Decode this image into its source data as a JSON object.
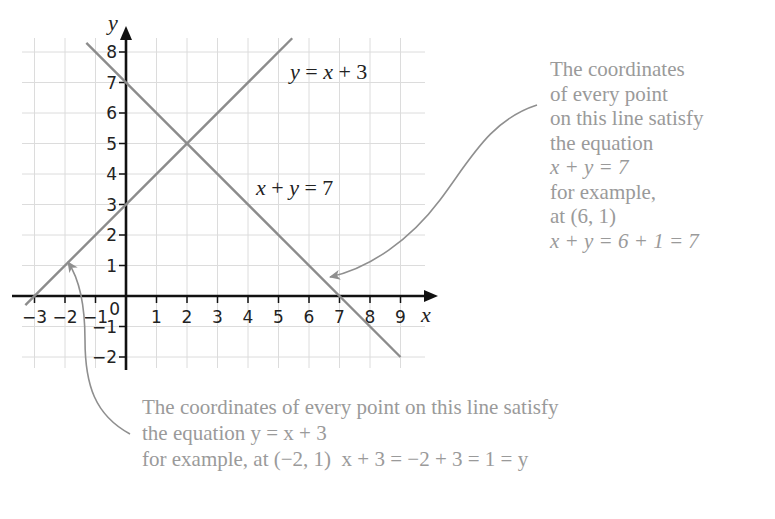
{
  "chart_data": {
    "type": "line",
    "title": "",
    "xlabel": "x",
    "ylabel": "y",
    "xlim": [
      -3.4,
      9.8
    ],
    "ylim": [
      -2.4,
      8.6
    ],
    "grid": true,
    "x_ticks": [
      "-3",
      "-2",
      "-1",
      "0",
      "1",
      "2",
      "3",
      "4",
      "5",
      "6",
      "7",
      "8",
      "9"
    ],
    "y_ticks": [
      "-2",
      "-1",
      "1",
      "2",
      "3",
      "4",
      "5",
      "6",
      "7",
      "8"
    ],
    "series": [
      {
        "name": "y = x + 3",
        "equation": "y = x + 3",
        "x": [
          -3.3,
          5.45
        ],
        "y": [
          -0.3,
          8.45
        ],
        "color": "#8c8c8c"
      },
      {
        "name": "x + y = 7",
        "equation": "x + y = 7",
        "x": [
          -1.3,
          9.0
        ],
        "y": [
          8.3,
          -2.0
        ],
        "color": "#8c8c8c"
      }
    ],
    "annotations": [
      {
        "text": "y = x + 3",
        "at": [
          5.5,
          7.4
        ]
      },
      {
        "text": "x + y = 7",
        "at": [
          4.2,
          3.3
        ]
      },
      {
        "text": "Intersection",
        "point": [
          2,
          5
        ]
      },
      {
        "text": "example point",
        "point": [
          6,
          1
        ]
      },
      {
        "text": "example point",
        "point": [
          -2,
          1
        ]
      }
    ]
  },
  "diagram": {
    "axis_x_label": "x",
    "axis_y_label": "y",
    "origin_label": "0",
    "label_line1": {
      "y": "y",
      "eq": " = ",
      "x": "x",
      "rest": " + 3"
    },
    "label_line2": {
      "x": "x",
      "plus": " + ",
      "y": "y",
      "rest": " = 7"
    }
  },
  "notes": {
    "right": {
      "lines": [
        "The coordinates",
        "of every point",
        "on this line satisfy",
        "the equation",
        "x + y = 7",
        "for example,",
        "at (6, 1)",
        "x + y = 6 + 1 = 7"
      ]
    },
    "bottom": {
      "lines": [
        "The coordinates of every point on this line satisfy",
        "the equation y = x + 3",
        "for example, at (−2, 1)  x + 3 = −2 + 3 = 1 = y"
      ]
    }
  }
}
